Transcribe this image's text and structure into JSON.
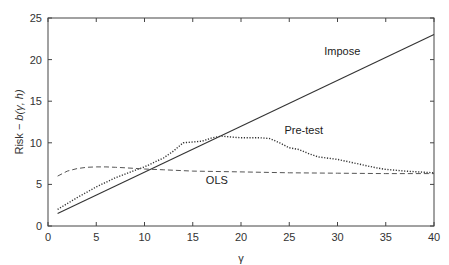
{
  "chart_data": {
    "type": "line",
    "title": "",
    "xlabel": "γ",
    "ylabel": "Risk − b(γ, h)",
    "xlim": [
      0,
      40
    ],
    "ylim": [
      0,
      25
    ],
    "xticks": [
      0,
      5,
      10,
      15,
      20,
      25,
      30,
      35,
      40
    ],
    "yticks": [
      0,
      5,
      10,
      15,
      20,
      25
    ],
    "grid": false,
    "legend": "inline labels",
    "series": [
      {
        "name": "Impose",
        "style": "solid",
        "x": [
          1,
          40
        ],
        "y": [
          1.5,
          23.0
        ]
      },
      {
        "name": "Pre-test",
        "style": "dotted",
        "x": [
          1,
          3,
          5,
          7,
          9,
          10,
          12,
          13,
          14,
          15,
          16,
          17,
          18,
          19,
          20,
          21,
          22,
          23,
          24,
          25,
          26,
          27,
          28,
          30,
          32,
          34,
          35,
          37,
          40
        ],
        "y": [
          2.0,
          3.4,
          4.7,
          5.8,
          6.7,
          7.1,
          8.2,
          9.0,
          10.0,
          10.1,
          10.2,
          10.6,
          10.8,
          10.7,
          10.6,
          10.6,
          10.6,
          10.5,
          10.0,
          9.4,
          9.2,
          8.7,
          8.3,
          8.0,
          7.5,
          7.0,
          6.8,
          6.6,
          6.4
        ]
      },
      {
        "name": "OLS",
        "style": "dashed",
        "x": [
          1,
          2,
          3,
          4,
          5,
          6,
          7,
          8,
          10,
          12,
          15,
          20,
          25,
          30,
          35,
          40
        ],
        "y": [
          6.0,
          6.6,
          6.9,
          7.05,
          7.1,
          7.1,
          7.05,
          7.0,
          6.85,
          6.75,
          6.6,
          6.5,
          6.4,
          6.35,
          6.3,
          6.3
        ]
      }
    ],
    "annotations": [
      {
        "text": "Impose",
        "x": 30.5,
        "y": 20.5
      },
      {
        "text": "Pre-test",
        "x": 26.5,
        "y": 11.0
      },
      {
        "text": "OLS",
        "x": 17.5,
        "y": 5.0
      }
    ]
  }
}
